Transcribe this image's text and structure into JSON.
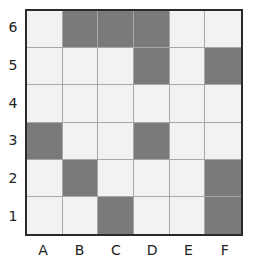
{
  "columns": [
    "A",
    "B",
    "C",
    "D",
    "E",
    "F"
  ],
  "rows": [
    "6",
    "5",
    "4",
    "3",
    "2",
    "1"
  ],
  "filled": {
    "6": [
      "B",
      "C",
      "D"
    ],
    "5": [
      "D",
      "F"
    ],
    "4": [],
    "3": [
      "A",
      "D"
    ],
    "2": [
      "B",
      "F"
    ],
    "1": [
      "C",
      "F"
    ]
  },
  "colors": {
    "filled": "#7a7a7a",
    "empty": "#f2f2f2",
    "border": "#2a2a2a",
    "gridline": "#a8a8a8"
  }
}
